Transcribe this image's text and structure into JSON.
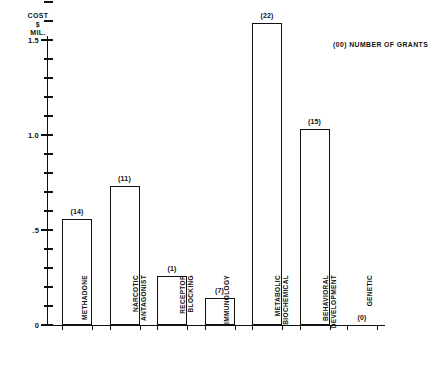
{
  "chart_data": {
    "type": "bar",
    "title": "",
    "ylabel": "COST $ MIL.",
    "ylabel_lines": [
      "COST",
      "$",
      "MIL."
    ],
    "xlabel": "",
    "ylim": [
      0,
      1.75
    ],
    "grid": false,
    "legend": "(00) NUMBER OF GRANTS",
    "legend_position": "top-right",
    "axis_ticks": {
      "major": [
        "0",
        ".5",
        "1.0",
        "1.5"
      ],
      "major_values": [
        0,
        0.5,
        1.0,
        1.5
      ],
      "minor_step": 0.1
    },
    "categories": [
      "METHADONE",
      "NARCOTIC ANTAGONIST",
      "RECEPTOR BLOCKING",
      "IMMUNOLOGY",
      "METABOLIC BIOCHEMICAL",
      "BEHAVIORAL DEVELOPMENT",
      "GENETIC"
    ],
    "category_lines": [
      [
        "METHADONE",
        ""
      ],
      [
        "NARCOTIC",
        "ANTAGONIST"
      ],
      [
        "RECEPTOR",
        "BLOCKING"
      ],
      [
        "IMMUNOLOGY",
        ""
      ],
      [
        "METABOLIC",
        "BIOCHEMICAL"
      ],
      [
        "BEHAVIORAL",
        "DEVELOPMENT"
      ],
      [
        "GENETIC",
        ""
      ]
    ],
    "values": [
      0.56,
      0.73,
      0.26,
      0.14,
      1.59,
      1.03,
      0.0
    ],
    "data_labels": [
      "(14)",
      "(11)",
      "(1)",
      "(7)",
      "(22)",
      "(15)",
      "(0)"
    ],
    "grant_counts": [
      14,
      11,
      1,
      7,
      22,
      15,
      0
    ],
    "colors": {
      "bar_fill": "#ffffff",
      "bar_stroke": "#111111",
      "axis": "#111111",
      "text": "#111111",
      "background": "#ffffff"
    }
  }
}
